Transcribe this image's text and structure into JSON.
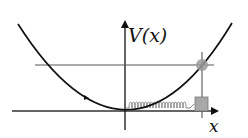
{
  "diagram": {
    "type": "potential-energy-diagram",
    "y_axis_label": "V(x)",
    "x_axis_label": "x",
    "curve": "parabola (harmonic potential)",
    "energy_level": "horizontal line (total energy)",
    "particle": "gray ball on curve at turning point",
    "oscillator": "spring attached to block along x-axis",
    "colors": {
      "line": "#111111",
      "axis": "#333333",
      "energy_line": "#555555",
      "ball": "#9a9a9a",
      "block": "#a8a8a8",
      "spring": "#7a7a7a",
      "background": "#ffffff"
    }
  }
}
